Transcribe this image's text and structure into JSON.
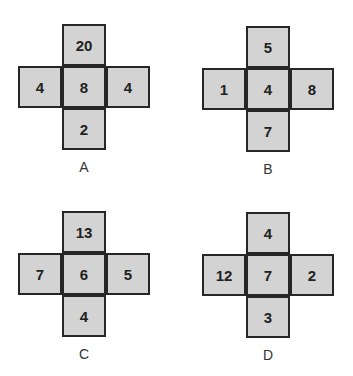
{
  "figures": [
    {
      "label": "A",
      "top": "20",
      "left": "4",
      "center": "8",
      "right": "4",
      "bottom": "2"
    },
    {
      "label": "B",
      "top": "5",
      "left": "1",
      "center": "4",
      "right": "8",
      "bottom": "7"
    },
    {
      "label": "C",
      "top": "13",
      "left": "7",
      "center": "6",
      "right": "5",
      "bottom": "4"
    },
    {
      "label": "D",
      "top": "4",
      "left": "12",
      "center": "7",
      "right": "2",
      "bottom": "3"
    }
  ],
  "colors": {
    "cell_fill": "#d3d3d3",
    "cell_border": "#262626",
    "background": "#ffffff"
  }
}
